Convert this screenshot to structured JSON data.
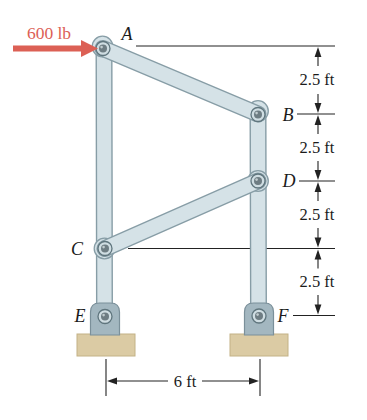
{
  "figure": {
    "type": "statics-frame-diagram",
    "force": {
      "label": "600 lb",
      "color": "#dc6055"
    },
    "joints": {
      "A": "A",
      "B": "B",
      "C": "C",
      "D": "D",
      "E": "E",
      "F": "F"
    },
    "dimensions": {
      "right": [
        "2.5 ft",
        "2.5 ft",
        "2.5 ft",
        "2.5 ft"
      ],
      "bottom": "6 ft"
    },
    "colors": {
      "member_fill": "#d5e2e7",
      "member_outline": "#879da6",
      "pin_core": "#6e7d83",
      "support_bracket": "#a3b7c0",
      "base_block": "#dbcba4",
      "dimension_line": "#222222",
      "force_red": "#dc6055"
    }
  }
}
